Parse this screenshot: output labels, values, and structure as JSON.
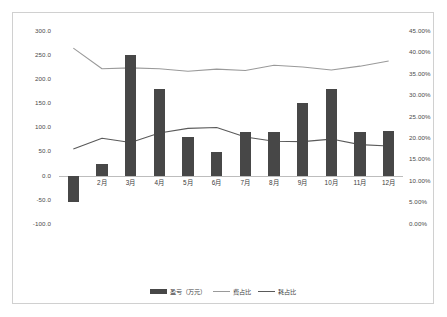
{
  "chart_data": {
    "type": "bar",
    "title": "",
    "xlabel": "",
    "ylabel": "",
    "grid": false,
    "legend_position": "bottom",
    "categories": [
      "1月",
      "2月",
      "3月",
      "4月",
      "5月",
      "6月",
      "7月",
      "8月",
      "9月",
      "10月",
      "11月",
      "12月"
    ],
    "x_tick_labels": [
      "",
      "2月",
      "3月",
      "4月",
      "5月",
      "6月",
      "7月",
      "8月",
      "9月",
      "10月",
      "11月",
      "12月"
    ],
    "primary_axis": {
      "name": "left",
      "ylim": [
        -100.0,
        300.0
      ],
      "tick_values": [
        -100.0,
        -50.0,
        0.0,
        50.0,
        100.0,
        150.0,
        200.0,
        250.0,
        300.0
      ],
      "tick_labels": [
        "-100.0",
        "-50.0",
        "0.0",
        "50.0",
        "100.0",
        "150.0",
        "200.0",
        "250.0",
        "300.0"
      ]
    },
    "secondary_axis": {
      "name": "right",
      "ylim": [
        0.0,
        45.0
      ],
      "tick_values": [
        0.0,
        5.0,
        10.0,
        15.0,
        20.0,
        25.0,
        30.0,
        35.0,
        40.0,
        45.0
      ],
      "tick_labels": [
        "0.00%",
        "5.00%",
        "10.00%",
        "15.00%",
        "20.00%",
        "25.00%",
        "30.00%",
        "35.00%",
        "40.00%",
        "45.00%"
      ]
    },
    "series": [
      {
        "name": "盈亏（万元）",
        "chart_type": "bar",
        "axis": "left",
        "color": "#474747",
        "values": [
          -55,
          25,
          250,
          180,
          80,
          50,
          90,
          90,
          150,
          180,
          90,
          92
        ]
      },
      {
        "name": "费占比",
        "chart_type": "line",
        "axis": "right",
        "color": "#9a9a9a",
        "values": [
          41.0,
          36.2,
          36.4,
          36.2,
          35.6,
          36.1,
          35.8,
          37.0,
          36.6,
          35.9,
          36.8,
          38.0
        ]
      },
      {
        "name": "耗占比",
        "chart_type": "line",
        "axis": "right",
        "color": "#5a5a5a",
        "values": [
          17.5,
          20.0,
          19.0,
          21.2,
          22.3,
          22.5,
          20.3,
          19.3,
          19.2,
          19.8,
          18.5,
          18.2
        ]
      }
    ]
  },
  "legend": {
    "items": [
      {
        "label": "盈亏（万元）",
        "marker": "bar-swatch"
      },
      {
        "label": "费占比",
        "marker": "line-swatch"
      },
      {
        "label": "耗占比",
        "marker": "line-swatch-dark"
      }
    ]
  }
}
